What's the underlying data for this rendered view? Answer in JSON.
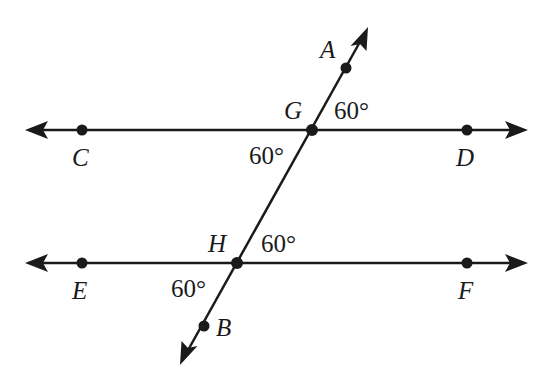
{
  "diagram": {
    "type": "parallel lines cut by a transversal",
    "lines": [
      {
        "name": "line-CD",
        "points": [
          "C",
          "G",
          "D"
        ],
        "y": 130,
        "x1": 25,
        "x2": 527
      },
      {
        "name": "line-EF",
        "points": [
          "E",
          "H",
          "F"
        ],
        "y": 263,
        "x1": 25,
        "x2": 527
      },
      {
        "name": "transversal-AB",
        "points": [
          "A",
          "G",
          "H",
          "B"
        ],
        "start": [
          180,
          365
        ],
        "end": [
          368,
          27
        ]
      }
    ],
    "points": {
      "A": {
        "label": "A",
        "x": 346,
        "y": 68,
        "lx": 320,
        "ly": 58
      },
      "C": {
        "label": "C",
        "x": 82,
        "y": 130,
        "lx": 72,
        "ly": 166
      },
      "D": {
        "label": "D",
        "x": 467,
        "y": 130,
        "lx": 457,
        "ly": 166
      },
      "G": {
        "label": "G",
        "x": 312,
        "y": 130,
        "lx": 284,
        "ly": 119
      },
      "E": {
        "label": "E",
        "x": 82,
        "y": 263,
        "lx": 72,
        "ly": 299
      },
      "F": {
        "label": "F",
        "x": 467,
        "y": 263,
        "lx": 458,
        "ly": 299
      },
      "H": {
        "label": "H",
        "x": 237,
        "y": 263,
        "lx": 208,
        "ly": 252
      },
      "B": {
        "label": "B",
        "x": 204,
        "y": 326,
        "lx": 216,
        "ly": 336
      }
    },
    "angles": [
      {
        "name": "angle-at-G-upper-right",
        "label": "60°",
        "x": 336,
        "y": 119
      },
      {
        "name": "angle-at-G-lower-left",
        "label": "60°",
        "x": 250,
        "y": 164
      },
      {
        "name": "angle-at-H-upper-right",
        "label": "60°",
        "x": 262,
        "y": 252
      },
      {
        "name": "angle-at-H-lower-left",
        "label": "60°",
        "x": 172,
        "y": 297
      }
    ]
  },
  "text": {
    "A": "A",
    "B": "B",
    "C": "C",
    "D": "D",
    "E": "E",
    "F": "F",
    "G": "G",
    "H": "H",
    "angle_G_upper": "60°",
    "angle_G_lower": "60°",
    "angle_H_upper": "60°",
    "angle_H_lower": "60°"
  }
}
